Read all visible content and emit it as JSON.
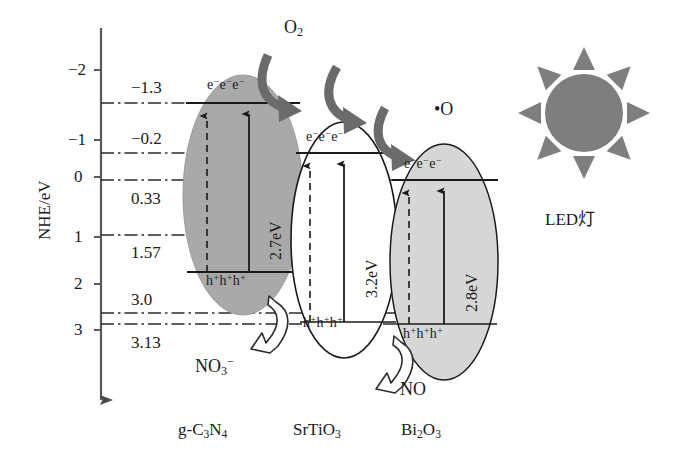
{
  "figure": {
    "kind": "band-structure-photocatalysis-diagram",
    "axis": {
      "label": "NHE/eV",
      "ticks": [
        "−2",
        "−1",
        "0",
        "1",
        "2",
        "3"
      ],
      "tick_values": [
        -2,
        -1,
        0,
        1,
        2,
        3
      ],
      "direction": "downward-increasing"
    },
    "levels": [
      {
        "label": "−1.3",
        "value": -1.3,
        "style": "dash-dot"
      },
      {
        "label": "−0.2",
        "value": -0.2,
        "style": "dash-dot"
      },
      {
        "label": "0.33",
        "value": 0.33,
        "style": "dash-dot"
      },
      {
        "label": "1.57",
        "value": 1.57,
        "style": "dash-dot"
      },
      {
        "label": "3.0",
        "value": 3.0,
        "style": "dash-dot"
      },
      {
        "label": "3.13",
        "value": 3.13,
        "style": "dash-dot"
      }
    ],
    "materials": [
      {
        "name": "g-C3N4",
        "name_html": "g-C<sub>3</sub>N<sub>4</sub>",
        "bandgap": "2.7eV",
        "bandgap_value": 2.7,
        "cb_level": -1.3,
        "vb_level": 1.57,
        "electrons": "e−e−e−",
        "holes": "h+h+h+",
        "fill": "#a9a9a9"
      },
      {
        "name": "SrTiO3",
        "name_html": "SrTiO<sub>3</sub>",
        "bandgap": "3.2eV",
        "bandgap_value": 3.2,
        "cb_level": -0.2,
        "vb_level": 3.0,
        "electrons": "e−e−e−",
        "holes": "h+h+h+",
        "fill": "#ffffff"
      },
      {
        "name": "Bi2O3",
        "name_html": "Bi<sub>2</sub>O<sub>3</sub>",
        "bandgap": "2.8eV",
        "bandgap_value": 2.8,
        "cb_level": 0.33,
        "vb_level": 3.13,
        "electrons": "e−e−e−",
        "holes": "h+h+h+",
        "fill": "#d6d6d6"
      }
    ],
    "species": [
      {
        "id": "o2",
        "label": "O2",
        "label_html": "O<sub>2</sub>"
      },
      {
        "id": "odot",
        "label": "•O",
        "label_html": "•O"
      },
      {
        "id": "no3",
        "label": "NO3−",
        "label_html": "NO<sub>3</sub><sup>−</sup>"
      },
      {
        "id": "no",
        "label": "NO",
        "label_html": "NO"
      }
    ],
    "light_source": {
      "label": "LED灯",
      "icon": "sun-icon",
      "rays": 8,
      "color": "#7e7e7e"
    },
    "colors": {
      "ink": "#1a1a1a",
      "arrow_dark": "#6b6b6b",
      "arrow_outline": "#2b2b2b",
      "gcn_fill": "#a9a9a9",
      "srtio3_fill": "#ffffff",
      "bi2o3_fill": "#d6d6d6",
      "sun": "#7e7e7e"
    }
  }
}
